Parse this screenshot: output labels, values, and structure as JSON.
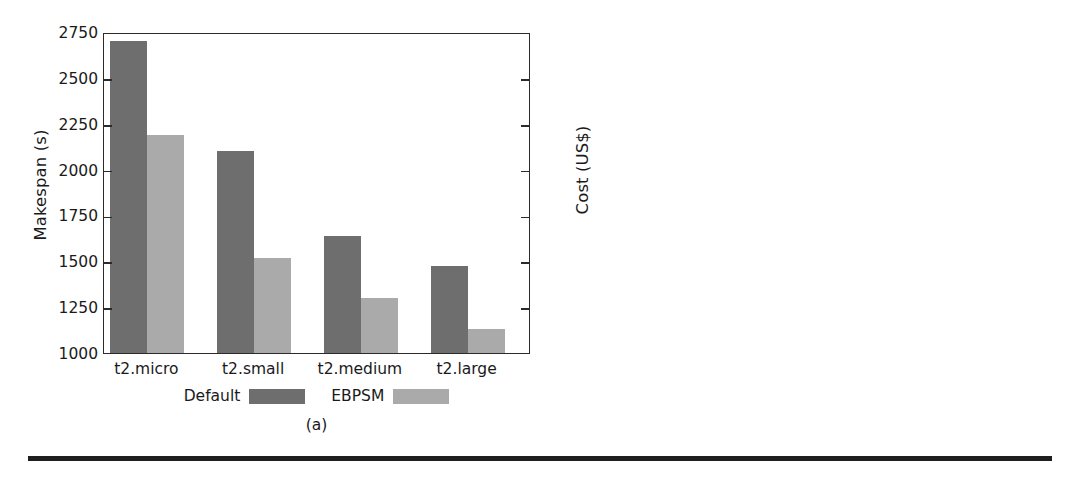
{
  "figure": {
    "bottom_rule_color": "#1f1f1f",
    "series_colors": {
      "Default": "#6e6e6e",
      "EBPSM": "#aaaaaa"
    }
  },
  "panels": [
    {
      "id": "a",
      "subcaption": "(a)",
      "legend": [
        {
          "label": "Default",
          "swatch": "dark"
        },
        {
          "label": "EBPSM",
          "swatch": "light"
        }
      ]
    },
    {
      "id": "b",
      "subcaption": "(b)",
      "legend": [
        {
          "label": "Default",
          "swatch": "dark"
        },
        {
          "label": "EBPSM",
          "swatch": "light"
        }
      ]
    }
  ],
  "chart_data": [
    {
      "type": "bar",
      "panel": "(a)",
      "title": "",
      "xlabel": "",
      "ylabel": "Makespan (s)",
      "categories": [
        "t2.micro",
        "t2.small",
        "t2.medium",
        "t2.large"
      ],
      "series": [
        {
          "name": "Default",
          "color": "#6e6e6e",
          "values": [
            2700,
            2100,
            1640,
            1475
          ]
        },
        {
          "name": "EBPSM",
          "color": "#aaaaaa",
          "values": [
            2190,
            1520,
            1300,
            1130
          ]
        }
      ],
      "ylim": [
        1000,
        2750
      ],
      "yticks": [
        1000,
        1250,
        1500,
        1750,
        2000,
        2250,
        2500,
        2750
      ],
      "ytick_labels": [
        "1000",
        "1250",
        "1500",
        "1750",
        "2000",
        "2250",
        "2500",
        "2750"
      ],
      "grid": false,
      "legend_position": "below-axis"
    },
    {
      "type": "bar",
      "panel": "(b)",
      "title": "",
      "xlabel": "",
      "ylabel": "Cost (US$)",
      "categories": [
        "t2.micro",
        "t2.small",
        "t2.medium",
        "t2.large"
      ],
      "series": [
        {
          "name": "Default",
          "color": "#6e6e6e",
          "values": [
            0.072,
            0.08,
            0.172,
            0.332
          ]
        },
        {
          "name": "EBPSM",
          "color": "#aaaaaa",
          "values": [
            0.082,
            0.108,
            0.29,
            0.493
          ]
        }
      ],
      "ylim": [
        0,
        0.55
      ],
      "yticks": [
        0,
        0.11,
        0.22,
        0.33,
        0.44,
        0.55
      ],
      "ytick_labels": [
        "0",
        "0.11",
        "0.22",
        "0.33",
        "0.44",
        "0.55"
      ],
      "grid": false,
      "legend_position": "below-axis"
    }
  ]
}
